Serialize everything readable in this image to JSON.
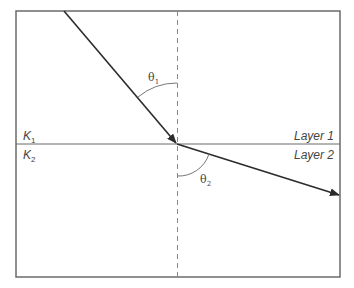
{
  "diagram": {
    "layers": {
      "upper": {
        "name": "Layer 1",
        "symbol": "K",
        "subscript": "1"
      },
      "lower": {
        "name": "Layer 2",
        "symbol": "K",
        "subscript": "2"
      }
    },
    "angles": {
      "incident": {
        "symbol": "θ",
        "subscript": "1"
      },
      "refracted": {
        "symbol": "θ",
        "subscript": "2"
      }
    },
    "colors": {
      "frame": "#6b6b6b",
      "ray": "#2b2b2b",
      "normal": "#888888",
      "arc": "#777777"
    }
  }
}
